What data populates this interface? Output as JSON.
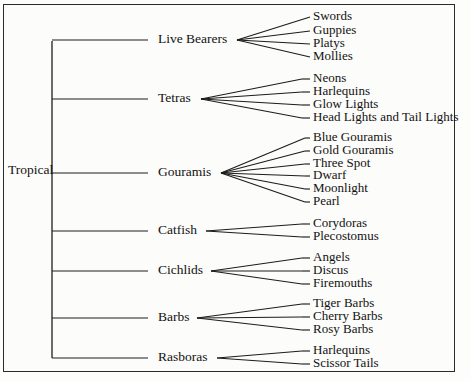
{
  "diagram": {
    "type": "tree",
    "orientation": "left-to-right",
    "border_color": "#2a2a2a",
    "line_color": "#1c1c1c",
    "background_color": "#fcfcfa",
    "root": {
      "label": "Tropical",
      "x": 8,
      "y": 171
    },
    "spine": {
      "x": 52,
      "top": 41,
      "bottom": 358
    },
    "groups": [
      {
        "label": "Live Bearers",
        "label_x": 158,
        "label_y": 40,
        "fan_x": 237,
        "leaf_x": 313,
        "stub_start_x": 310,
        "children": [
          {
            "label": "Swords",
            "y": 17
          },
          {
            "label": "Guppies",
            "y": 31
          },
          {
            "label": "Platys",
            "y": 44
          },
          {
            "label": "Mollies",
            "y": 57
          }
        ]
      },
      {
        "label": "Tetras",
        "label_x": 158,
        "label_y": 99,
        "fan_x": 201,
        "leaf_x": 313,
        "stub_start_x": 302,
        "children": [
          {
            "label": "Neons",
            "y": 79
          },
          {
            "label": "Harlequins",
            "y": 92
          },
          {
            "label": "Glow Lights",
            "y": 105
          },
          {
            "label": "Head Lights and Tail Lights",
            "y": 118
          }
        ]
      },
      {
        "label": "Gouramis",
        "label_x": 158,
        "label_y": 173,
        "fan_x": 221,
        "leaf_x": 313,
        "stub_start_x": 305,
        "children": [
          {
            "label": "Blue Gouramis",
            "y": 138
          },
          {
            "label": "Gold Gouramis",
            "y": 151
          },
          {
            "label": "Three Spot",
            "y": 164
          },
          {
            "label": "Dwarf",
            "y": 176
          },
          {
            "label": "Moonlight",
            "y": 189
          },
          {
            "label": "Pearl",
            "y": 202
          }
        ]
      },
      {
        "label": "Catfish",
        "label_x": 158,
        "label_y": 231,
        "fan_x": 206,
        "leaf_x": 313,
        "stub_start_x": 302,
        "children": [
          {
            "label": "Corydoras",
            "y": 224
          },
          {
            "label": "Plecostomus",
            "y": 237
          }
        ]
      },
      {
        "label": "Cichlids",
        "label_x": 158,
        "label_y": 271,
        "fan_x": 211,
        "leaf_x": 313,
        "stub_start_x": 302,
        "children": [
          {
            "label": "Angels",
            "y": 258
          },
          {
            "label": "Discus",
            "y": 271
          },
          {
            "label": "Firemouths",
            "y": 284
          }
        ]
      },
      {
        "label": "Barbs",
        "label_x": 158,
        "label_y": 318,
        "fan_x": 197,
        "leaf_x": 313,
        "stub_start_x": 302,
        "children": [
          {
            "label": "Tiger Barbs",
            "y": 304
          },
          {
            "label": "Cherry Barbs",
            "y": 317
          },
          {
            "label": "Rosy Barbs",
            "y": 330
          }
        ]
      },
      {
        "label": "Rasboras",
        "label_x": 158,
        "label_y": 358,
        "fan_x": 217,
        "leaf_x": 313,
        "stub_start_x": 302,
        "children": [
          {
            "label": "Harlequins",
            "y": 351
          },
          {
            "label": "Scissor Tails",
            "y": 364
          }
        ]
      }
    ]
  }
}
